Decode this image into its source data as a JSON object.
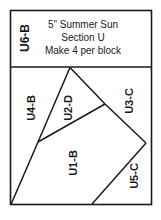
{
  "document": {
    "type": "quilt-paper-piecing-pattern",
    "border_color": "#1a1a1a",
    "background_color": "#ffffff"
  },
  "header": {
    "side_label": "U6-B",
    "title": "5\" Summer Sun",
    "section": "Section U",
    "instruction": "Make 4 per block"
  },
  "pattern": {
    "pieces": [
      {
        "id": "u1",
        "label": "U1-B",
        "x": 73,
        "y": 163,
        "rotation": -90,
        "font_size": 11
      },
      {
        "id": "u2",
        "label": "U2-D",
        "x": 68,
        "y": 108,
        "rotation": -90,
        "font_size": 11
      },
      {
        "id": "u3",
        "label": "U3-C",
        "x": 129,
        "y": 101,
        "rotation": -90,
        "font_size": 11
      },
      {
        "id": "u4",
        "label": "U4-B",
        "x": 31,
        "y": 108,
        "rotation": -90,
        "font_size": 11
      },
      {
        "id": "u5",
        "label": "U5-C",
        "x": 134,
        "y": 176,
        "rotation": -90,
        "font_size": 11
      }
    ],
    "seam_lines": [
      {
        "name": "u4-u2-seam",
        "from": [
          70,
          67
        ],
        "to": [
          38,
          142
        ]
      },
      {
        "name": "u4-u1-seam",
        "from": [
          38,
          142
        ],
        "to": [
          11,
          204
        ]
      },
      {
        "name": "u2-u3-seam",
        "from": [
          70,
          67
        ],
        "to": [
          105,
          104
        ]
      },
      {
        "name": "u1-u2-u3-seam",
        "from": [
          105,
          104
        ],
        "to": [
          38,
          142
        ]
      },
      {
        "name": "u3-u1-seam",
        "from": [
          105,
          104
        ],
        "to": [
          146,
          143
        ]
      },
      {
        "name": "u5-u1-seam",
        "from": [
          146,
          143
        ],
        "to": [
          92,
          204
        ]
      }
    ],
    "outer_frame": {
      "x": 10,
      "y": 10,
      "width": 142,
      "height": 195
    },
    "header_divider_y": 67
  }
}
